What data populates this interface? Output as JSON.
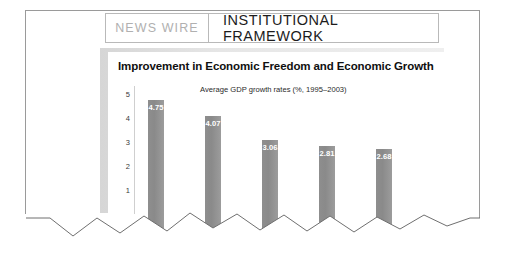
{
  "header": {
    "kicker": "NEWS WIRE",
    "section_title": "INSTITUTIONAL FRAMEWORK"
  },
  "chart_data": {
    "type": "bar",
    "title": "Improvement in Economic Freedom and Economic Growth",
    "subtitle": "Average GDP growth rates (%, 1995–2003)",
    "xlabel": "",
    "ylabel": "",
    "categories": [
      "",
      "",
      "",
      "",
      ""
    ],
    "values": [
      4.75,
      4.07,
      3.06,
      2.81,
      2.68
    ],
    "value_labels": [
      "4.75",
      "4.07",
      "3.06",
      "2.81",
      "2.68"
    ],
    "ylim": [
      0,
      5.4
    ],
    "yticks": [
      5,
      4,
      3,
      2,
      1
    ],
    "ytick_labels": [
      "5",
      "4",
      "3",
      "2",
      "1"
    ],
    "grid": false,
    "legend": false,
    "bar_color": "#8f8f8f",
    "label_color": "#ffffff"
  }
}
